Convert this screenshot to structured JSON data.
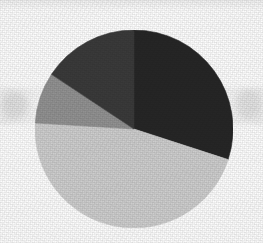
{
  "figure": {
    "kind": "pie-chart",
    "background_color": "#f9f9f9",
    "center_x": 134,
    "center_y": 129,
    "radius": 99,
    "title": "",
    "legend": "none",
    "labels_shown": "none"
  },
  "chart_data": {
    "type": "pie",
    "title": "",
    "xlabel": "",
    "ylabel": "",
    "legend_position": "none",
    "grid": false,
    "start_angle_deg": 0,
    "direction": "clockwise",
    "total": 100,
    "units": "percent",
    "categories": [
      "Segment 1",
      "Segment 2",
      "Segment 3",
      "Segment 4"
    ],
    "values": [
      30.0,
      45.9,
      8.3,
      15.8
    ],
    "colors": [
      "#262626",
      "#cdcdcd",
      "#919191",
      "#3a3a3a"
    ],
    "slices": [
      {
        "name": "Segment 1",
        "value": 30.0,
        "color": "#262626",
        "start_angle_deg": 0.0,
        "end_angle_deg": 108.0,
        "sweep_deg": 108.0
      },
      {
        "name": "Segment 2",
        "value": 45.9,
        "color": "#cdcdcd",
        "start_angle_deg": 108.0,
        "end_angle_deg": 273.5,
        "sweep_deg": 165.5
      },
      {
        "name": "Segment 3",
        "value": 8.3,
        "color": "#919191",
        "start_angle_deg": 273.5,
        "end_angle_deg": 303.5,
        "sweep_deg": 30.0
      },
      {
        "name": "Segment 4",
        "value": 15.8,
        "color": "#3a3a3a",
        "start_angle_deg": 303.5,
        "end_angle_deg": 360.0,
        "sweep_deg": 56.5
      }
    ]
  }
}
